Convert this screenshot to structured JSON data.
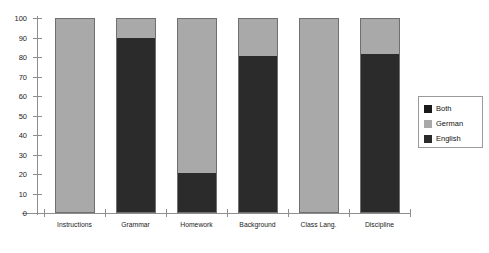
{
  "chart_data": {
    "type": "bar",
    "stacked": true,
    "title": "",
    "subtitle": "",
    "xlabel": "",
    "ylabel": "",
    "ylim": [
      0,
      100
    ],
    "ytick_labels": [
      "0",
      "10",
      "20",
      "30",
      "40",
      "50",
      "60",
      "70",
      "80",
      "90",
      "100"
    ],
    "ytick_values": [
      0,
      10,
      20,
      30,
      40,
      50,
      60,
      70,
      80,
      90,
      100
    ],
    "grid": false,
    "legend_position": "right",
    "categories": [
      "Instructions",
      "Grammar",
      "Homework",
      "Background",
      "Class Lang.",
      "Discipline"
    ],
    "series": [
      {
        "name": "English",
        "color": "#2b2b2b",
        "values": [
          0,
          90,
          20,
          81,
          0,
          82
        ]
      },
      {
        "name": "German",
        "color": "#a9a9a9",
        "values": [
          100,
          10,
          80,
          19,
          100,
          18
        ]
      },
      {
        "name": "Both",
        "color": "#1a1a1a",
        "values": [
          0,
          0,
          0,
          0,
          0,
          0
        ]
      }
    ],
    "stack_order_bottom_to_top": [
      "English",
      "German",
      "Both"
    ]
  },
  "legend": {
    "entries": [
      {
        "label": "Both",
        "color": "#1a1a1a"
      },
      {
        "label": "German",
        "color": "#a9a9a9"
      },
      {
        "label": "English",
        "color": "#2b2b2b"
      }
    ]
  },
  "colors": {
    "english": "#2b2b2b",
    "german": "#a9a9a9",
    "both": "#1a1a1a",
    "axis": "#8e8e8e",
    "bar_border": "#6f6f6f",
    "background": "#ffffff",
    "text": "#1c1c1c"
  }
}
